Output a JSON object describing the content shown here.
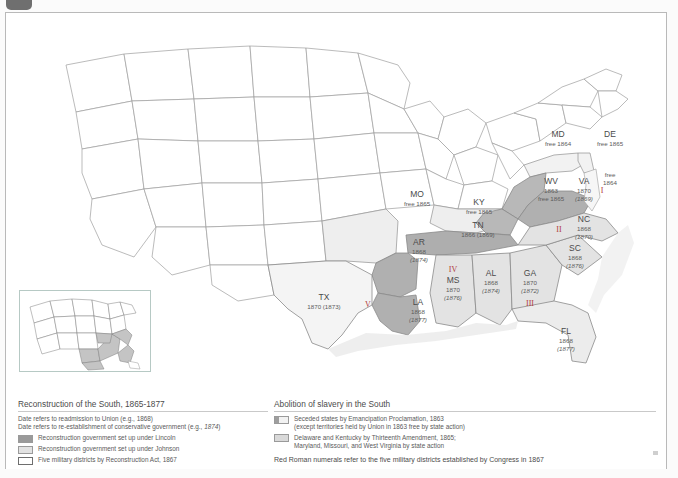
{
  "map": {
    "title": "Reconstruction of the South, 1865-1877",
    "states": [
      {
        "abbr": "MD",
        "line1": "free 1864",
        "line2": "",
        "numeral": ""
      },
      {
        "abbr": "DE",
        "line1": "free 1865",
        "line2": "",
        "numeral": ""
      },
      {
        "abbr": "WV",
        "line1": "1863",
        "line2": "free 1865",
        "numeral": ""
      },
      {
        "abbr": "VA",
        "line1": "1870",
        "line2": "(1869)",
        "numeral": "I"
      },
      {
        "abbr": "NC",
        "line1": "1868",
        "line2": "(1870)",
        "numeral": "II"
      },
      {
        "abbr": "SC",
        "line1": "1868",
        "line2": "(1876)",
        "numeral": ""
      },
      {
        "abbr": "GA",
        "line1": "1870",
        "line2": "(1872)",
        "numeral": "III"
      },
      {
        "abbr": "FL",
        "line1": "1868",
        "line2": "(1877)",
        "numeral": ""
      },
      {
        "abbr": "AL",
        "line1": "1868",
        "line2": "(1874)",
        "numeral": ""
      },
      {
        "abbr": "MS",
        "line1": "1870",
        "line2": "(1876)",
        "numeral": "IV"
      },
      {
        "abbr": "LA",
        "line1": "1868",
        "line2": "(1877)",
        "numeral": ""
      },
      {
        "abbr": "AR",
        "line1": "1868",
        "line2": "(1874)",
        "numeral": ""
      },
      {
        "abbr": "TN",
        "line1": "1866 (1869)",
        "line2": "",
        "numeral": ""
      },
      {
        "abbr": "KY",
        "line1": "free 1865",
        "line2": "",
        "numeral": ""
      },
      {
        "abbr": "MO",
        "line1": "free 1865",
        "line2": "",
        "numeral": ""
      },
      {
        "abbr": "TX",
        "line1": "1870 (1873)",
        "line2": "",
        "numeral": "V"
      }
    ],
    "eastern_shore_note": {
      "line1": "free",
      "line2": "1864"
    },
    "colors": {
      "lincoln": "#9a9a9a",
      "johnson": "#e2e2e2",
      "district_border": "#6e6e6e",
      "numeral_red": "#b03a3a",
      "state_outline": "#8d8d8d",
      "land": "#ffffff"
    }
  },
  "legend": {
    "left": {
      "title": "Reconstruction of the South, 1865-1877",
      "note_1_prefix": "Date refers to readmission to Union (e.g., ",
      "note_1_value": "1868",
      "note_1_suffix": ")",
      "note_2_prefix": "Date refers to re-establishment of conservative government (e.g., ",
      "note_2_value": "1874",
      "note_2_suffix": ")",
      "items": [
        {
          "swatch": "lincoln",
          "label": "Reconstruction government set up under Lincoln"
        },
        {
          "swatch": "johnson",
          "label": "Reconstruction government set up under Johnson"
        },
        {
          "swatch": "district",
          "label": "Five military districts by Reconstruction Act, 1867"
        }
      ]
    },
    "right": {
      "title": "Abolition of slavery in the South",
      "items": [
        {
          "swatch": "emanc",
          "line1": "Seceded states by Emancipation Proclamation, 1863",
          "line2": "(except territories held by Union in 1863 free by state action)"
        },
        {
          "swatch": "thirteenth",
          "line1": "Delaware and Kentucky by Thirteenth Amendment, 1865;",
          "line2": "Maryland, Missouri, and West Virginia by state action"
        }
      ],
      "footnote": "Red Roman numerals refer to the five military districts established by Congress in 1867"
    }
  }
}
